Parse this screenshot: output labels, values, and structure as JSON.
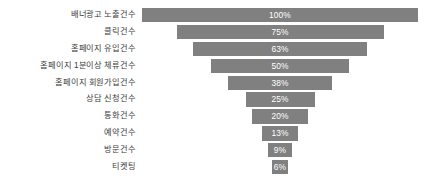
{
  "chart_data": {
    "type": "bar",
    "subtype": "funnel",
    "title": "",
    "xlabel": "",
    "ylabel": "",
    "grid": false,
    "legend": "none",
    "orientation": "horizontal-centered",
    "xlim": [
      0,
      100
    ],
    "bar_color": "#808080",
    "value_label_color": "#ffffff",
    "category_label_color": "#3b3b3b",
    "categories": [
      "배너광고 노출건수",
      "클릭건수",
      "홈페이지 유입건수",
      "홈페이지 1분이상 체류건수",
      "홈페이지 회원가입건수",
      "상담 신청건수",
      "통화건수",
      "예약건수",
      "방문건수",
      "티켓팅"
    ],
    "values": [
      100,
      75,
      63,
      50,
      38,
      25,
      20,
      13,
      9,
      6
    ],
    "value_labels": [
      "100%",
      "75%",
      "63%",
      "50%",
      "38%",
      "25%",
      "20%",
      "13%",
      "9%",
      "6%"
    ]
  },
  "rows": [
    {
      "label": "배너광고 노출건수",
      "value": 100,
      "value_label": "100%"
    },
    {
      "label": "클릭건수",
      "value": 75,
      "value_label": "75%"
    },
    {
      "label": "홈페이지 유입건수",
      "value": 63,
      "value_label": "63%"
    },
    {
      "label": "홈페이지 1분이상 체류건수",
      "value": 50,
      "value_label": "50%"
    },
    {
      "label": "홈페이지 회원가입건수",
      "value": 38,
      "value_label": "38%"
    },
    {
      "label": "상담 신청건수",
      "value": 25,
      "value_label": "25%"
    },
    {
      "label": "통화건수",
      "value": 20,
      "value_label": "20%"
    },
    {
      "label": "예약건수",
      "value": 13,
      "value_label": "13%"
    },
    {
      "label": "방문건수",
      "value": 9,
      "value_label": "9%"
    },
    {
      "label": "티켓팅",
      "value": 6,
      "value_label": "6%"
    }
  ]
}
